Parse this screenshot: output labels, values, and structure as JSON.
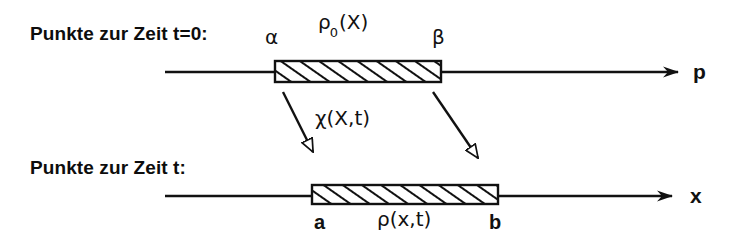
{
  "figure": {
    "kind": "continuum-mechanics-deformation-diagram",
    "background_color": "#ffffff",
    "ink_color": "#111111"
  },
  "rows": {
    "reference": {
      "caption": "Punkte zur Zeit t=0:",
      "axis_label": "p",
      "left_endpoint_label": "α",
      "right_endpoint_label": "β",
      "density_symbol": "ρ",
      "density_subscript": "0",
      "density_argument": "(X)"
    },
    "current": {
      "caption": "Punkte zur Zeit t:",
      "axis_label": "x",
      "left_endpoint_label": "a",
      "right_endpoint_label": "b",
      "density_label": "ρ(x,t)"
    }
  },
  "mapping": {
    "label": "χ(X,t)",
    "arrow_count": 2,
    "arrow_head_style": "hollow-triangle"
  },
  "geometry": {
    "reference_axis": {
      "x1": 165,
      "x2": 678,
      "y": 72
    },
    "current_axis": {
      "x1": 165,
      "x2": 672,
      "y": 196
    },
    "reference_bar": {
      "x": 275,
      "y": 61,
      "width": 166,
      "height": 21
    },
    "current_bar": {
      "x": 312,
      "y": 185,
      "width": 186,
      "height": 19
    },
    "arrow_left": {
      "x1": 283,
      "y1": 92,
      "x2": 313,
      "y2": 152
    },
    "arrow_right": {
      "x1": 433,
      "y1": 92,
      "x2": 478,
      "y2": 158
    }
  }
}
